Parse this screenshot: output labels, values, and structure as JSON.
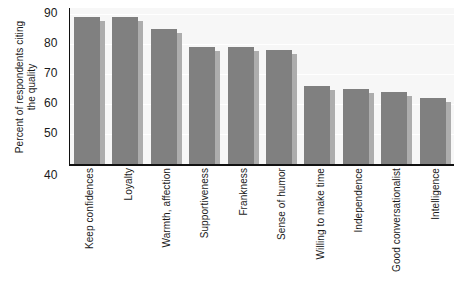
{
  "chart_data": {
    "type": "bar",
    "title": "",
    "subtitle": "",
    "xlabel": "",
    "ylabel": "Percent of respondents citing the quality",
    "ylabel_line1": "Percent of respondents citing",
    "ylabel_line2": "the quality",
    "ylim": [
      40,
      92
    ],
    "yticks": [
      90,
      80,
      70,
      60,
      50,
      40
    ],
    "ytick_labels": [
      "90",
      "80",
      "70",
      "60",
      "50",
      "40"
    ],
    "grid": true,
    "grid_axis": "y",
    "legend": false,
    "bar_color": "#808080",
    "bar_shadow_color": "#adadad",
    "plot_background": "#f7f7f7",
    "axis_color": "#111111",
    "categories": [
      "Keep confidences",
      "Loyalty",
      "Warmth, affection",
      "Supportiveness",
      "Frankness",
      "Sense of humor",
      "Willing to make time",
      "Independence",
      "Good conversationalist",
      "Intelligence"
    ],
    "values": [
      89,
      89,
      85,
      79,
      79,
      78,
      66,
      65,
      64,
      62
    ]
  }
}
